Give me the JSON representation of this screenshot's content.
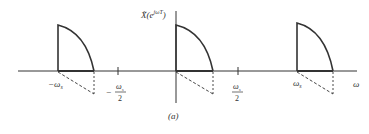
{
  "figure": {
    "caption": "(a)",
    "ylabel": "X̃(e",
    "ylabel_sup": "jωT",
    "ylabel_close": ")",
    "xlabel": "ω",
    "colors": {
      "stroke": "#333333",
      "background": "#ffffff"
    }
  },
  "ticks": [
    {
      "id": "neg_ws",
      "label_main": "−ω",
      "label_sub": "s",
      "fraction": false
    },
    {
      "id": "neg_ws_half",
      "sign": "−",
      "numerator": "ω",
      "numerator_sub": "s",
      "denominator": "2",
      "fraction": true
    },
    {
      "id": "pos_ws_half",
      "numerator": "ω",
      "numerator_sub": "s",
      "denominator": "2",
      "fraction": true
    },
    {
      "id": "pos_ws",
      "label_main": "ω",
      "label_sub": "s",
      "fraction": false
    }
  ],
  "spectral_copies": [
    {
      "center": "−ωs",
      "shape": "quarter-curve with dashed mirror triangle"
    },
    {
      "center": "0",
      "shape": "quarter-curve with dashed mirror triangle"
    },
    {
      "center": "ωs",
      "shape": "quarter-curve with dashed mirror triangle"
    }
  ]
}
